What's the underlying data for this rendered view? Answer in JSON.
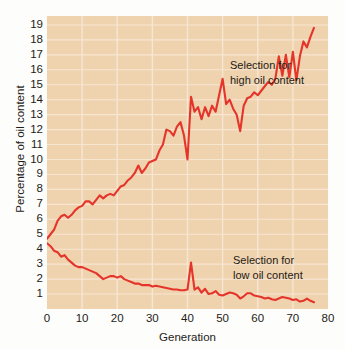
{
  "chart_data": {
    "type": "line",
    "title": "",
    "subtitle": "",
    "xlabel": "Generation",
    "ylabel": "Percentage of oil content",
    "xlim": [
      0,
      80
    ],
    "ylim": [
      0,
      19.6
    ],
    "grid": true,
    "legend_position": "inline-annotation",
    "xticks": [
      0,
      10,
      20,
      30,
      40,
      50,
      60,
      70,
      80
    ],
    "yticks": [
      1,
      2,
      3,
      4,
      5,
      6,
      7,
      8,
      9,
      10,
      11,
      12,
      13,
      14,
      15,
      16,
      17,
      18,
      19
    ],
    "line_color": "#e5342a",
    "plot_background": "#efd2ae",
    "gridline_color": "#f7e6d2",
    "figure_background": "#fdfdfc",
    "annotations": [
      {
        "id": "high",
        "text": "Selection for\nhigh oil content",
        "x": 40,
        "y": 16.6
      },
      {
        "id": "low",
        "text": "Selection for\nlow oil content",
        "x": 40,
        "y": 4.2
      }
    ],
    "series": [
      {
        "name": "Selection for high oil content",
        "color": "#e5342a",
        "x": [
          0,
          1,
          2,
          3,
          4,
          5,
          6,
          7,
          8,
          9,
          10,
          11,
          12,
          13,
          14,
          15,
          16,
          17,
          18,
          19,
          20,
          21,
          22,
          23,
          24,
          25,
          26,
          27,
          28,
          29,
          30,
          31,
          32,
          33,
          34,
          35,
          36,
          37,
          38,
          39,
          40,
          41,
          42,
          43,
          44,
          45,
          46,
          47,
          48,
          49,
          50,
          51,
          52,
          53,
          54,
          55,
          56,
          57,
          58,
          59,
          60,
          61,
          62,
          63,
          64,
          65,
          66,
          67,
          68,
          69,
          70,
          71,
          72,
          73,
          74,
          75,
          76
        ],
        "values": [
          4.7,
          5.0,
          5.3,
          5.9,
          6.2,
          6.3,
          6.1,
          6.3,
          6.6,
          6.8,
          6.9,
          7.2,
          7.2,
          7.0,
          7.3,
          7.6,
          7.4,
          7.6,
          7.7,
          7.6,
          7.9,
          8.2,
          8.3,
          8.6,
          8.8,
          9.1,
          9.6,
          9.1,
          9.4,
          9.8,
          9.9,
          10.0,
          10.6,
          11.0,
          12.0,
          11.9,
          11.6,
          12.2,
          12.5,
          11.6,
          10.0,
          14.2,
          13.2,
          13.5,
          12.7,
          13.5,
          12.9,
          13.6,
          13.2,
          14.3,
          15.4,
          13.7,
          14.0,
          13.4,
          13.0,
          11.9,
          13.6,
          14.1,
          14.2,
          14.5,
          14.3,
          14.6,
          14.9,
          15.2,
          15.0,
          15.4,
          16.9,
          15.6,
          17.0,
          15.5,
          17.2,
          15.3,
          16.9,
          17.9,
          17.5,
          18.2,
          18.8
        ]
      },
      {
        "name": "Selection for low oil content",
        "color": "#e5342a",
        "x": [
          0,
          1,
          2,
          3,
          4,
          5,
          6,
          7,
          8,
          9,
          10,
          11,
          12,
          13,
          14,
          15,
          16,
          17,
          18,
          19,
          20,
          21,
          22,
          23,
          24,
          25,
          26,
          27,
          28,
          29,
          30,
          31,
          32,
          33,
          34,
          35,
          36,
          37,
          38,
          39,
          40,
          41,
          42,
          43,
          44,
          45,
          46,
          47,
          48,
          49,
          50,
          51,
          52,
          53,
          54,
          55,
          56,
          57,
          58,
          59,
          60,
          61,
          62,
          63,
          64,
          65,
          66,
          67,
          68,
          69,
          70,
          71,
          72,
          73,
          74,
          75,
          76
        ],
        "values": [
          4.4,
          4.2,
          3.9,
          3.8,
          3.5,
          3.6,
          3.3,
          3.1,
          2.9,
          2.8,
          2.8,
          2.7,
          2.6,
          2.5,
          2.4,
          2.2,
          2.0,
          2.1,
          2.2,
          2.2,
          2.1,
          2.2,
          2.0,
          1.9,
          1.8,
          1.7,
          1.7,
          1.6,
          1.6,
          1.6,
          1.5,
          1.55,
          1.5,
          1.45,
          1.4,
          1.35,
          1.3,
          1.3,
          1.25,
          1.25,
          1.3,
          3.1,
          1.3,
          1.45,
          1.1,
          1.35,
          1.0,
          1.05,
          1.2,
          0.95,
          0.9,
          1.0,
          1.1,
          1.05,
          0.95,
          0.7,
          0.85,
          1.05,
          1.05,
          0.9,
          0.85,
          0.8,
          0.7,
          0.75,
          0.65,
          0.6,
          0.7,
          0.8,
          0.75,
          0.7,
          0.6,
          0.65,
          0.5,
          0.55,
          0.7,
          0.55,
          0.45
        ]
      }
    ]
  }
}
